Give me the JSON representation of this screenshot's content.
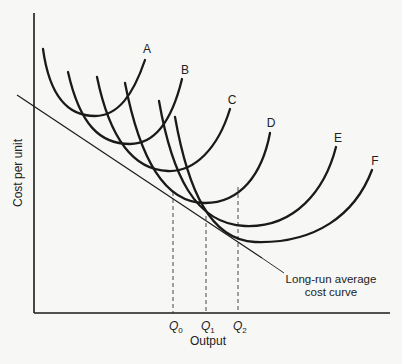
{
  "diagram": {
    "type": "economics-cost-curves",
    "y_axis_label": "Cost per unit",
    "x_axis_label": "Output",
    "short_run_curves": [
      {
        "label": "A"
      },
      {
        "label": "B"
      },
      {
        "label": "C"
      },
      {
        "label": "D"
      },
      {
        "label": "E"
      },
      {
        "label": "F"
      }
    ],
    "quantity_markers": [
      {
        "label": "Q",
        "sub": "0"
      },
      {
        "label": "Q",
        "sub": "1"
      },
      {
        "label": "Q",
        "sub": "2"
      }
    ],
    "lrac_label_line1": "Long-run average",
    "lrac_label_line2": "cost curve",
    "colors": {
      "background": "#f7f7f5",
      "ink": "#1a1a1a"
    }
  }
}
